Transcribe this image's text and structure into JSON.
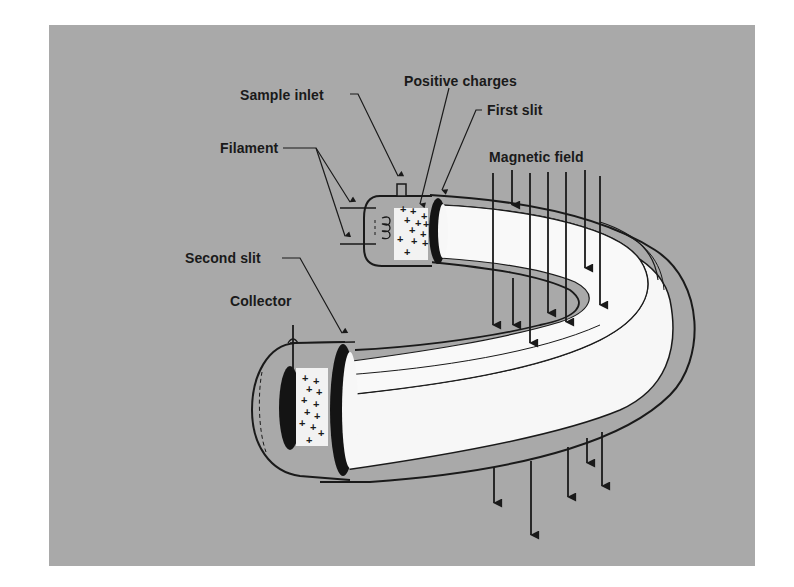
{
  "diagram": {
    "background_color": "#a9a9a9",
    "tube_color": "#f7f7f7",
    "ink_color": "#1a1a1a",
    "labels": {
      "positive_charges": "Positive charges",
      "sample_inlet": "Sample inlet",
      "first_slit": "First slit",
      "filament": "Filament",
      "magnetic_field": "Magnetic field",
      "second_slit": "Second slit",
      "collector": "Collector"
    },
    "symbols": {
      "charge": "+"
    }
  }
}
